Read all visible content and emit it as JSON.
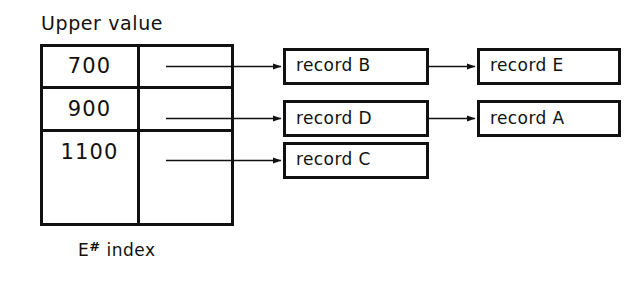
{
  "figure": {
    "title": "Upper value",
    "caption_prefix": "E",
    "caption_symbol": "#",
    "caption_suffix": "index",
    "ink_color": "#111111",
    "background_color": "#ffffff"
  },
  "index_table": {
    "label": "Upper value",
    "rows": [
      {
        "upper_value": "700",
        "pointer": "record B"
      },
      {
        "upper_value": "900",
        "pointer": "record D"
      },
      {
        "upper_value": "1100",
        "pointer": "record C"
      },
      {
        "upper_value": "",
        "pointer": ""
      }
    ]
  },
  "chains": [
    {
      "from_row": "700",
      "records": [
        {
          "label": "record B"
        },
        {
          "label": "record E"
        }
      ]
    },
    {
      "from_row": "900",
      "records": [
        {
          "label": "record D"
        },
        {
          "label": "record A"
        }
      ]
    },
    {
      "from_row": "1100",
      "records": [
        {
          "label": "record C"
        }
      ]
    }
  ],
  "records": {
    "r0c0": "record B",
    "r0c1": "record E",
    "r1c0": "record D",
    "r1c1": "record A",
    "r2c0": "record C"
  }
}
